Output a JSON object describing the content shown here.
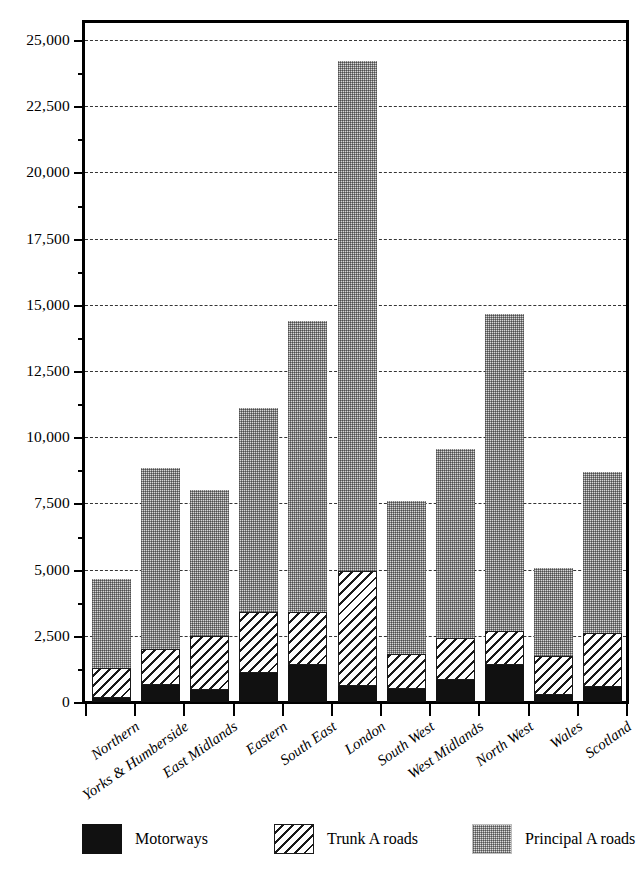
{
  "chart_data": {
    "type": "bar",
    "subtype": "stacked-vertical",
    "title": "",
    "xlabel": "",
    "ylabel": "",
    "ylim": [
      0,
      25000
    ],
    "y_major_step": 2500,
    "y_minor_step": 1250,
    "grid": true,
    "grid_style": "dashed-horizontal-major",
    "legend_position": "bottom",
    "y_tick_labels": [
      "25,000",
      "22,500",
      "20,000",
      "17,500",
      "15,000",
      "12,500",
      "10,000",
      "7,500",
      "5,000",
      "2,500",
      "0"
    ],
    "y_tick_values": [
      25000,
      22500,
      20000,
      17500,
      15000,
      12500,
      10000,
      7500,
      5000,
      2500,
      0
    ],
    "categories": [
      "Northern",
      "Yorks & Humberside",
      "East Midlands",
      "Eastern",
      "South East",
      "London",
      "South West",
      "West Midlands",
      "North West",
      "Wales",
      "Scotland"
    ],
    "series": [
      {
        "name": "Motorways",
        "fill": "solid-black",
        "color": "#111111",
        "values": [
          150,
          650,
          450,
          1100,
          1400,
          600,
          500,
          850,
          1400,
          250,
          550
        ]
      },
      {
        "name": "Trunk A roads",
        "fill": "diagonal-hatch",
        "color": "#ffffff",
        "values": [
          1150,
          1350,
          2050,
          2300,
          2000,
          4350,
          1300,
          1550,
          1300,
          1500,
          2050
        ]
      },
      {
        "name": "Principal A roads",
        "fill": "stipple-grey",
        "color": "#d8d8d8",
        "values": [
          3350,
          6850,
          5500,
          7700,
          11000,
          19250,
          5800,
          7150,
          11950,
          3300,
          6100
        ]
      }
    ],
    "stack_totals": [
      4650,
      8850,
      8000,
      11100,
      14400,
      24200,
      7600,
      9550,
      14650,
      5050,
      8700
    ]
  },
  "legend": {
    "items": [
      {
        "label": "Motorways",
        "swatch": "solid-black-swatch"
      },
      {
        "label": "Trunk A roads",
        "swatch": "diagonal-hatch-swatch"
      },
      {
        "label": "Principal A roads",
        "swatch": "stipple-grey-swatch"
      }
    ]
  }
}
